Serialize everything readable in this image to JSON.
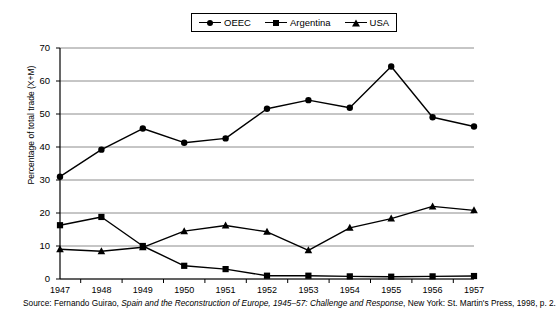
{
  "chart_data": {
    "type": "line",
    "title": "",
    "xlabel": "",
    "ylabel": "Percentage of total trade (X+M)",
    "categories": [
      "1947",
      "1948",
      "1949",
      "1950",
      "1951",
      "1952",
      "1953",
      "1954",
      "1955",
      "1956",
      "1957"
    ],
    "ylim": [
      0,
      70
    ],
    "ytick_step": 10,
    "yticks": [
      0,
      10,
      20,
      30,
      40,
      50,
      60,
      70
    ],
    "grid": "horizontal",
    "legend_position": "top-center",
    "series": [
      {
        "name": "OEEC",
        "marker": "circle",
        "color": "#000000",
        "values": [
          31.0,
          39.2,
          45.6,
          41.3,
          42.6,
          51.6,
          54.2,
          51.9,
          64.4,
          49.0,
          46.2
        ]
      },
      {
        "name": "Argentina",
        "marker": "square",
        "color": "#000000",
        "values": [
          16.3,
          18.8,
          10.0,
          4.0,
          3.0,
          1.0,
          1.0,
          0.8,
          0.7,
          0.8,
          0.9
        ]
      },
      {
        "name": "USA",
        "marker": "triangle",
        "color": "#000000",
        "values": [
          9.0,
          8.4,
          9.6,
          14.5,
          16.2,
          14.3,
          8.7,
          15.5,
          18.3,
          22.0,
          20.8
        ]
      }
    ]
  },
  "legend": {
    "items": [
      {
        "label": "OEEC",
        "marker": "circle"
      },
      {
        "label": "Argentina",
        "marker": "square"
      },
      {
        "label": "USA",
        "marker": "triangle"
      }
    ]
  },
  "axes": {
    "y_title": "Percentage of total trade (X+M)",
    "y_tick_labels": [
      "70",
      "60",
      "50",
      "40",
      "30",
      "20",
      "10",
      "0"
    ],
    "x_tick_labels": [
      "1947",
      "1948",
      "1949",
      "1950",
      "1951",
      "1952",
      "1953",
      "1954",
      "1955",
      "1956",
      "1957"
    ]
  },
  "source": {
    "prefix": "Source: Fernando Guirao, ",
    "title_italic": "Spain and the Reconstruction of Europe, 1945–57: Challenge and Response",
    "suffix": ", New York: St. Martin's Press, 1998, p. 2."
  }
}
